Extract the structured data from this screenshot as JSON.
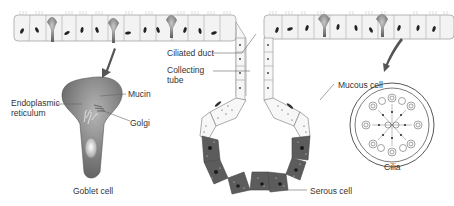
{
  "diagram": {
    "type": "anatomical illustration",
    "labels": {
      "mucin": "Mucin",
      "endoplasmic_reticulum_1": "Endoplasmic",
      "endoplasmic_reticulum_2": "reticulum",
      "golgi": "Golgi",
      "goblet_cell": "Goblet cell",
      "ciliated_duct": "Ciliated duct",
      "collecting_tube_1": "Collecting",
      "collecting_tube_2": "tube",
      "mucous_cell": "Mucous cell",
      "serous_cell": "Serous cell",
      "cilia": "Cilia"
    },
    "colors": {
      "epithelium_fill": "#f2f2f2",
      "outline": "#9a9a9a",
      "goblet_fill": "#6e6e6e",
      "serous_fill": "#5a5a5a",
      "nucleus": "#222222",
      "text": "#333333"
    }
  }
}
